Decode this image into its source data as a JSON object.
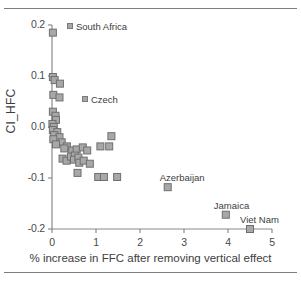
{
  "figure": {
    "has_top_rule": true,
    "has_bottom_rule": true,
    "background": "#ffffff"
  },
  "chart_data": {
    "type": "scatter",
    "title": "",
    "xlabel": "% increase in FFC after removing vertical effect",
    "ylabel": "CI_HFC",
    "xlim": [
      0,
      5
    ],
    "ylim": [
      -0.2,
      0.2
    ],
    "xticks": [
      0,
      1,
      2,
      3,
      4,
      5
    ],
    "xticklabels": [
      "0",
      "1",
      "2",
      "3",
      "4",
      "5"
    ],
    "yticks": [
      -0.2,
      -0.1,
      0.0,
      0.1,
      0.2
    ],
    "yticklabels": [
      "-0.2",
      "-0.1",
      "0.0",
      "0.1",
      "0.2"
    ],
    "grid": false,
    "legend": "none",
    "marker": {
      "shape": "square",
      "fill": "#a8a8a8",
      "edge": "#6f6f6f",
      "size_px": 7
    },
    "axis_color": "#8a8a8a",
    "points": [
      {
        "x": 0.02,
        "y": 0.185,
        "label": "South Africa"
      },
      {
        "x": 0.02,
        "y": 0.098,
        "label": ""
      },
      {
        "x": 0.06,
        "y": 0.092,
        "label": ""
      },
      {
        "x": 0.18,
        "y": 0.085,
        "label": "Czech"
      },
      {
        "x": 0.03,
        "y": 0.063,
        "label": ""
      },
      {
        "x": 0.17,
        "y": 0.058,
        "label": ""
      },
      {
        "x": 0.02,
        "y": 0.03,
        "label": ""
      },
      {
        "x": 0.08,
        "y": 0.022,
        "label": ""
      },
      {
        "x": 0.09,
        "y": 0.014,
        "label": ""
      },
      {
        "x": 0.01,
        "y": 0.006,
        "label": ""
      },
      {
        "x": 0.04,
        "y": 0.0,
        "label": ""
      },
      {
        "x": 0.02,
        "y": -0.006,
        "label": ""
      },
      {
        "x": 0.12,
        "y": -0.01,
        "label": ""
      },
      {
        "x": 0.05,
        "y": -0.016,
        "label": ""
      },
      {
        "x": 0.17,
        "y": -0.02,
        "label": ""
      },
      {
        "x": 0.03,
        "y": -0.024,
        "label": ""
      },
      {
        "x": 0.22,
        "y": -0.03,
        "label": ""
      },
      {
        "x": 0.09,
        "y": -0.034,
        "label": ""
      },
      {
        "x": 0.34,
        "y": -0.038,
        "label": ""
      },
      {
        "x": 0.28,
        "y": -0.042,
        "label": ""
      },
      {
        "x": 0.46,
        "y": -0.046,
        "label": ""
      },
      {
        "x": 0.56,
        "y": -0.044,
        "label": ""
      },
      {
        "x": 0.7,
        "y": -0.04,
        "label": ""
      },
      {
        "x": 0.8,
        "y": -0.046,
        "label": ""
      },
      {
        "x": 1.1,
        "y": -0.038,
        "label": ""
      },
      {
        "x": 1.35,
        "y": -0.018,
        "label": ""
      },
      {
        "x": 1.3,
        "y": -0.038,
        "label": ""
      },
      {
        "x": 0.24,
        "y": -0.062,
        "label": ""
      },
      {
        "x": 0.33,
        "y": -0.066,
        "label": ""
      },
      {
        "x": 0.43,
        "y": -0.058,
        "label": ""
      },
      {
        "x": 0.52,
        "y": -0.056,
        "label": ""
      },
      {
        "x": 0.5,
        "y": -0.064,
        "label": ""
      },
      {
        "x": 0.6,
        "y": -0.06,
        "label": ""
      },
      {
        "x": 0.62,
        "y": -0.07,
        "label": ""
      },
      {
        "x": 0.72,
        "y": -0.066,
        "label": ""
      },
      {
        "x": 0.86,
        "y": -0.072,
        "label": ""
      },
      {
        "x": 0.58,
        "y": -0.09,
        "label": ""
      },
      {
        "x": 1.05,
        "y": -0.098,
        "label": ""
      },
      {
        "x": 1.18,
        "y": -0.098,
        "label": ""
      },
      {
        "x": 1.48,
        "y": -0.098,
        "label": ""
      },
      {
        "x": 2.63,
        "y": -0.118,
        "label": "Azerbaijan"
      },
      {
        "x": 3.95,
        "y": -0.172,
        "label": "Jamaica"
      },
      {
        "x": 4.5,
        "y": -0.2,
        "label": "Viet Nam"
      }
    ],
    "annotations": [
      {
        "text": "South Africa",
        "with_marker": true
      },
      {
        "text": "Czech",
        "with_marker": true
      },
      {
        "text": "Azerbaijan",
        "with_marker": false
      },
      {
        "text": "Jamaica",
        "with_marker": false
      },
      {
        "text": "Viet Nam",
        "with_marker": false
      }
    ]
  }
}
